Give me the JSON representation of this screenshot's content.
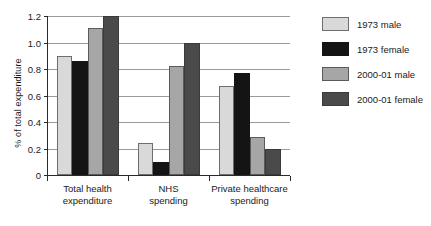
{
  "chart_data": {
    "type": "bar",
    "title": "",
    "xlabel": "",
    "ylabel": "% of total expenditure",
    "ylim": [
      0,
      1.2
    ],
    "yticks": [
      "0",
      "0.2",
      "0.4",
      "0.6",
      "0.8",
      "1.0",
      "1.2"
    ],
    "ytick_values": [
      0,
      0.2,
      0.4,
      0.6,
      0.8,
      1.0,
      1.2
    ],
    "grid": true,
    "legend_position": "right",
    "categories": [
      "Total health\nexpenditure",
      "NHS\nspending",
      "Private healthcare\nspending"
    ],
    "category_lines": [
      [
        "Total health",
        "expenditure"
      ],
      [
        "NHS",
        "spending"
      ],
      [
        "Private healthcare",
        "spending"
      ]
    ],
    "series": [
      {
        "name": "1973 male",
        "color": "#d9d9d9",
        "values": [
          0.9,
          0.24,
          0.67
        ]
      },
      {
        "name": "1973 female",
        "color": "#141414",
        "values": [
          0.86,
          0.1,
          0.77
        ]
      },
      {
        "name": "2000-01 male",
        "color": "#a6a6a6",
        "values": [
          1.11,
          0.82,
          0.29
        ]
      },
      {
        "name": "2000-01 female",
        "color": "#4a4a4a",
        "values": [
          1.2,
          1.0,
          0.2
        ]
      }
    ]
  }
}
